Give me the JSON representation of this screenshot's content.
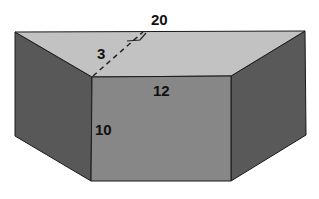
{
  "figure": {
    "labels": {
      "top_length": "20",
      "slant_height": "3",
      "bottom_length": "12",
      "depth": "10"
    },
    "colors": {
      "top_face": "#c2c2c2",
      "front_face": "#878787",
      "side_faces": "#585858",
      "edges": "#1a1a1a",
      "background": "#ffffff"
    }
  }
}
